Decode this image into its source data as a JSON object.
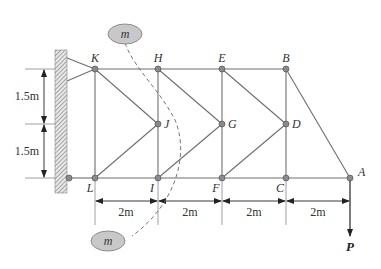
{
  "figure": {
    "type": "truss-diagram",
    "colors": {
      "member": "#6e6e6e",
      "node_fill": "#8a8a8a",
      "node_stroke": "#555555",
      "wall_hatch": "#777777",
      "mass_fill": "#c8c8c8",
      "text": "#333333"
    }
  },
  "nodes": {
    "K": {
      "label": "K"
    },
    "H": {
      "label": "H"
    },
    "E": {
      "label": "E"
    },
    "B": {
      "label": "B"
    },
    "J": {
      "label": "J"
    },
    "G": {
      "label": "G"
    },
    "D": {
      "label": "D"
    },
    "L": {
      "label": "L"
    },
    "I": {
      "label": "I"
    },
    "F": {
      "label": "F"
    },
    "C": {
      "label": "C"
    },
    "A": {
      "label": "A"
    }
  },
  "dimensions": {
    "vertical": [
      "1.5m",
      "1.5m"
    ],
    "horizontal": [
      "2m",
      "2m",
      "2m",
      "2m"
    ]
  },
  "masses": {
    "top": {
      "label": "m"
    },
    "bottom": {
      "label": "m"
    }
  },
  "load": {
    "label": "P"
  }
}
